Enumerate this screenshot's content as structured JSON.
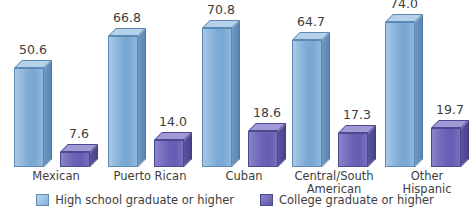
{
  "chart_data": {
    "type": "bar",
    "title": "",
    "subtitle": "",
    "xlabel": "",
    "ylabel": "",
    "ylim": [
      0,
      80
    ],
    "grid": false,
    "legend_position": "bottom-center",
    "value_label_format": "one-decimal",
    "categories": [
      "Mexican",
      "Puerto Rican",
      "Cuban",
      "Central/South American",
      "Other Hispanic"
    ],
    "category_lines": [
      [
        "Mexican"
      ],
      [
        "Puerto Rican"
      ],
      [
        "Cuban"
      ],
      [
        "Central/South",
        "American"
      ],
      [
        "Other",
        "Hispanic"
      ]
    ],
    "series": [
      {
        "name": "High school graduate or higher",
        "color": "#7eabd5",
        "values": [
          50.6,
          66.8,
          70.8,
          64.7,
          74.0
        ],
        "labels": [
          "50.6",
          "66.8",
          "70.8",
          "64.7",
          "74.0"
        ]
      },
      {
        "name": "College graduate or higher",
        "color": "#6962b6",
        "values": [
          7.6,
          14.0,
          18.6,
          17.3,
          19.7
        ],
        "labels": [
          "7.6",
          "14.0",
          "18.6",
          "17.3",
          "19.7"
        ]
      }
    ]
  },
  "legend": {
    "items": [
      {
        "label": "High school graduate or higher",
        "swatch": "legend-swatch-highschool"
      },
      {
        "label": "College graduate or higher",
        "swatch": "legend-swatch-college"
      }
    ]
  }
}
